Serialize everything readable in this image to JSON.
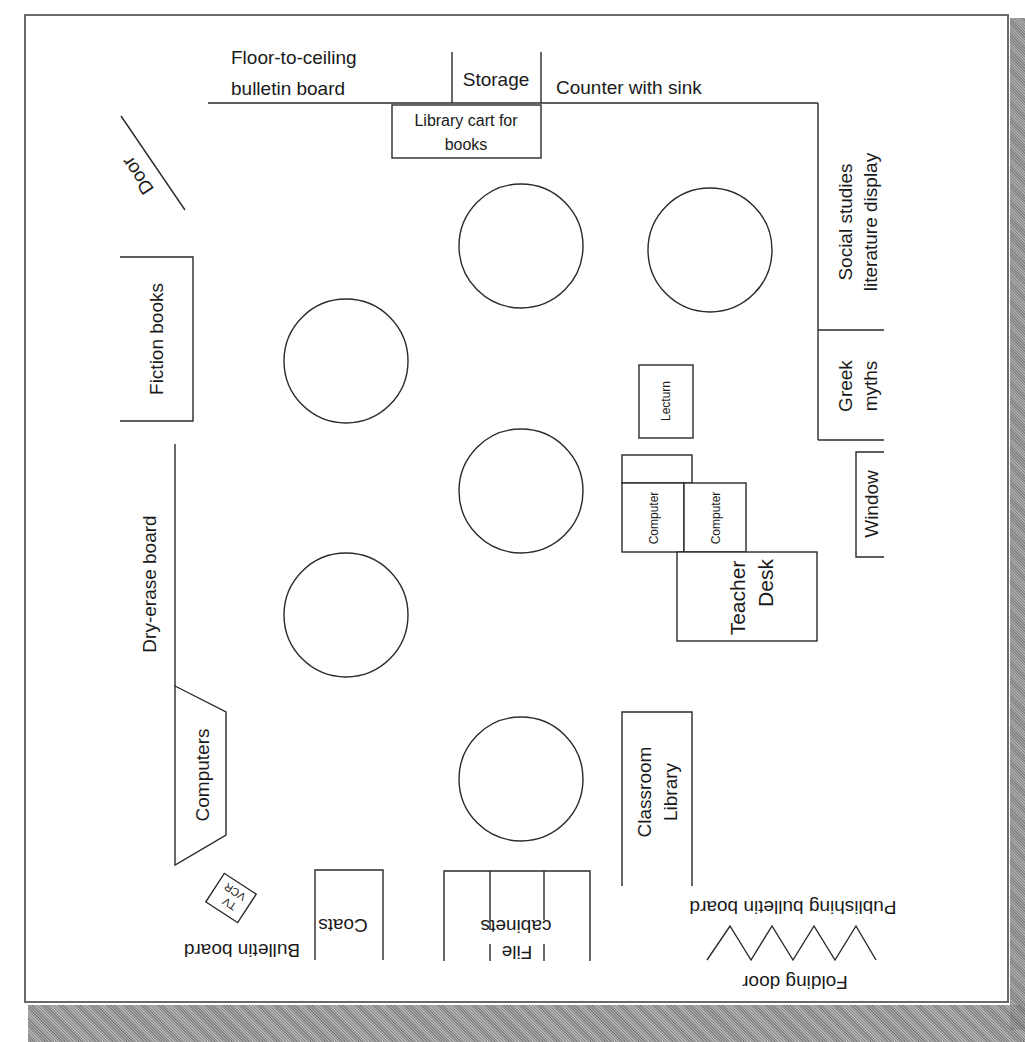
{
  "diagram": {
    "colors": {
      "line": "#2a2a2a",
      "frame": "#6a6a6a",
      "paper": "#ffffff",
      "shadow": "#8a8a8a"
    },
    "labels": {
      "bulletin_top_1": "Floor-to-ceiling",
      "bulletin_top_2": "bulletin board",
      "storage": "Storage",
      "counter": "Counter with sink",
      "cart_1": "Library cart for",
      "cart_2": "books",
      "door": "Door",
      "social_1": "Social studies",
      "social_2": "literature display",
      "greek_1": "Greek",
      "greek_2": "myths",
      "window": "Window",
      "fiction": "Fiction books",
      "lecturn": "Lecturn",
      "computer_a": "Computer",
      "computer_b": "Computer",
      "teacher_1": "Teacher",
      "teacher_2": "Desk",
      "dry_erase": "Dry-erase board",
      "computers": "Computers",
      "classroom_1": "Classroom",
      "classroom_2": "Library",
      "tv": "TV",
      "vcr": "VCR",
      "coats": "Coats",
      "bulletin_bottom": "Bulletin board",
      "file_1": "File",
      "file_2": "cabinets",
      "publishing": "Publishing bulletin board",
      "folding": "Folding door"
    },
    "tables": [
      {
        "id": "table-1",
        "cx": 521,
        "cy": 246,
        "r": 62
      },
      {
        "id": "table-2",
        "cx": 710,
        "cy": 250,
        "r": 62
      },
      {
        "id": "table-3",
        "cx": 346,
        "cy": 361,
        "r": 62
      },
      {
        "id": "table-4",
        "cx": 521,
        "cy": 491,
        "r": 62
      },
      {
        "id": "table-5",
        "cx": 346,
        "cy": 615,
        "r": 62
      },
      {
        "id": "table-6",
        "cx": 521,
        "cy": 779,
        "r": 62
      }
    ]
  }
}
